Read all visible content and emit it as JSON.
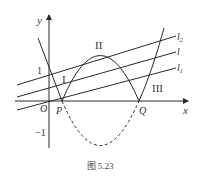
{
  "figure": {
    "axis_labels": {
      "x": "x",
      "y": "y"
    },
    "tick_labels": {
      "one": "1",
      "minus_one": "−1"
    },
    "points": {
      "origin": "O",
      "p": "P",
      "q": "Q"
    },
    "regions": {
      "i": "I",
      "ii": "II",
      "iii": "III"
    },
    "lines": [
      {
        "name": "l",
        "sub": "2"
      },
      {
        "name": "l",
        "sub": ""
      },
      {
        "name": "l",
        "sub": "1"
      }
    ],
    "caption": "图 5.23",
    "colors": {
      "stroke": "#2a2a2a",
      "background": "#ffffff"
    }
  }
}
